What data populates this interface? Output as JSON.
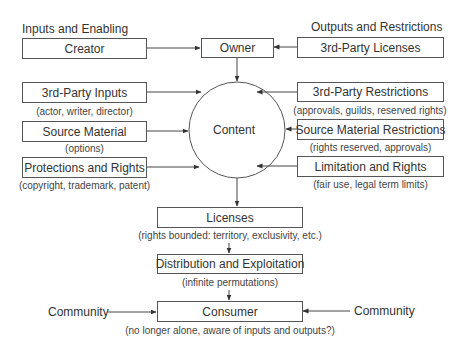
{
  "headings": {
    "left": "Inputs and Enabling",
    "right": "Outputs and Restrictions"
  },
  "nodes": {
    "creator": {
      "label": "Creator"
    },
    "owner": {
      "label": "Owner"
    },
    "third_party_licenses": {
      "label": "3rd-Party Licenses"
    },
    "content": {
      "label": "Content"
    },
    "inputs": [
      {
        "label": "3rd-Party Inputs",
        "caption": "(actor, writer, director)"
      },
      {
        "label": "Source Material",
        "caption": "(options)"
      },
      {
        "label": "Protections and Rights",
        "caption": "(copyright, trademark, patent)"
      }
    ],
    "restrictions": [
      {
        "label": "3rd-Party Restrictions",
        "caption": "(approvals, guilds, reserved rights)"
      },
      {
        "label": "Source Material Restrictions",
        "caption": "(rights reserved, approvals)"
      },
      {
        "label": "Limitation and Rights",
        "caption": "(fair use, legal term limits)"
      }
    ],
    "licenses": {
      "label": "Licenses",
      "caption": "(rights bounded: territory, exclusivity, etc.)"
    },
    "distribution": {
      "label": "Distribution and Exploitation",
      "caption": "(infinite permutations)"
    },
    "consumer": {
      "label": "Consumer",
      "caption": "(no longer alone, aware of inputs and outputs?)"
    },
    "community_left": {
      "label": "Community"
    },
    "community_right": {
      "label": "Community"
    }
  },
  "edges": [
    {
      "from": "Creator",
      "to": "Owner"
    },
    {
      "from": "3rd-Party Licenses",
      "to": "Owner"
    },
    {
      "from": "Owner",
      "to": "Content"
    },
    {
      "from": "3rd-Party Inputs",
      "to": "Content"
    },
    {
      "from": "Source Material",
      "to": "Content"
    },
    {
      "from": "Protections and Rights",
      "to": "Content"
    },
    {
      "from": "3rd-Party Restrictions",
      "to": "Content"
    },
    {
      "from": "Source Material Restrictions",
      "to": "Content"
    },
    {
      "from": "Limitation and Rights",
      "to": "Content"
    },
    {
      "from": "Content",
      "to": "Licenses"
    },
    {
      "from": "Licenses",
      "to": "Distribution and Exploitation"
    },
    {
      "from": "Distribution and Exploitation",
      "to": "Consumer"
    },
    {
      "from": "Community",
      "to": "Consumer"
    },
    {
      "from": "Community",
      "to": "Consumer"
    }
  ],
  "colors": {
    "line": "#444444",
    "text": "#333333",
    "background": "#ffffff"
  }
}
